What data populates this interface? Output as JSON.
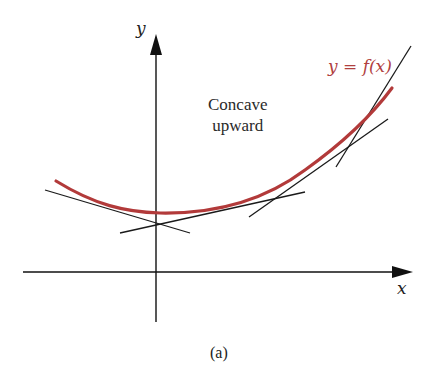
{
  "figure": {
    "caption": "(a)",
    "axes": {
      "x_label": "x",
      "y_label": "y"
    },
    "curve": {
      "label": "y = f(x)",
      "color": "#b23a3a"
    },
    "annotation": {
      "line1": "Concave",
      "line2": "upward"
    },
    "tangent_line_color": "#1a1a1a",
    "axis_color": "#111111",
    "tangent_count": 4
  }
}
